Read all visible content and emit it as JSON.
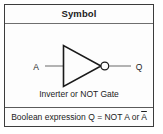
{
  "card": {
    "header_title": "Symbol",
    "gate_caption": "Inverter or NOT Gate",
    "expression_prefix": "Boolean expression Q = NOT A or ",
    "expression_overbar_term": "A",
    "input_label": "A",
    "output_label": "Q",
    "colors": {
      "border": "#3c3c3c",
      "rule": "#6e6e6e",
      "wire": "#8c8c8c",
      "gate_outline": "#1a1a1a",
      "background": "#fdfdfd",
      "text": "#1c1c1c"
    }
  }
}
